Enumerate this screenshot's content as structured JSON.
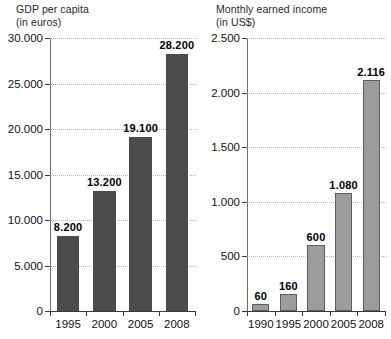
{
  "chart_data": [
    {
      "type": "bar",
      "panel": "left",
      "title": "GDP per capita",
      "subtitle": "(in euros)",
      "xlabel": "",
      "ylabel": "",
      "unit": "euros",
      "grid": true,
      "legend": "none",
      "ylim": [
        0,
        30000
      ],
      "ytick_values": [
        0,
        5000,
        10000,
        15000,
        20000,
        25000,
        30000
      ],
      "ytick_labels": [
        "0",
        "5.000",
        "10.000",
        "15.000",
        "20.000",
        "25.000",
        "30.000"
      ],
      "categories": [
        "1995",
        "2000",
        "2005",
        "2008"
      ],
      "values": [
        8200,
        13200,
        19100,
        28200
      ],
      "value_labels": [
        "8.200",
        "13.200",
        "19.100",
        "28.200"
      ],
      "bar_color": "#4b4b4b"
    },
    {
      "type": "bar",
      "panel": "right",
      "title": "Monthly earned income",
      "subtitle": "(in US$)",
      "xlabel": "",
      "ylabel": "",
      "unit": "US$",
      "grid": true,
      "legend": "none",
      "ylim": [
        0,
        2500
      ],
      "ytick_values": [
        0,
        500,
        1000,
        1500,
        2000,
        2500
      ],
      "ytick_labels": [
        "0",
        "500",
        "1.000",
        "1.500",
        "2.000",
        "2.500"
      ],
      "categories": [
        "1990",
        "1995",
        "2000",
        "2005",
        "2008"
      ],
      "values": [
        60,
        160,
        600,
        1080,
        2116
      ],
      "value_labels": [
        "60",
        "160",
        "600",
        "1.080",
        "2.116"
      ],
      "bar_color": "#9c9c9c",
      "bar_border_color": "#5d5d5d"
    }
  ],
  "colors": {
    "background": "#ffffff",
    "text": "#111111",
    "gridline": "#b4b4b4",
    "axis": "#3a3a3a"
  }
}
